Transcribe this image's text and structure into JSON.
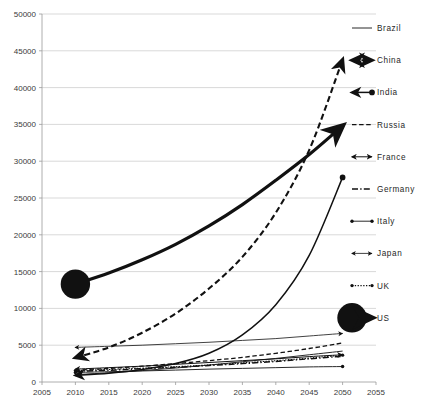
{
  "chart_data": {
    "type": "line",
    "title": "",
    "xlabel": "",
    "ylabel": "",
    "xlim": [
      2005,
      2055
    ],
    "ylim": [
      0,
      50000
    ],
    "grid": true,
    "legend_position": "right",
    "x_ticks": [
      "2005",
      "2010",
      "2015",
      "2020",
      "2025",
      "2030",
      "2035",
      "2040",
      "2045",
      "2050",
      "2055"
    ],
    "y_ticks": [
      "0",
      "5000",
      "10000",
      "15000",
      "20000",
      "25000",
      "30000",
      "35000",
      "40000",
      "45000",
      "50000"
    ],
    "x": [
      2010,
      2015,
      2020,
      2025,
      2030,
      2035,
      2040,
      2045,
      2050
    ],
    "series": [
      {
        "name": "Brazil",
        "marker": "plain-line",
        "values": [
          1000,
          1250,
          1550,
          1900,
          2300,
          2750,
          3200,
          3700,
          4200
        ]
      },
      {
        "name": "China",
        "marker": "double-arrow-bold",
        "values": [
          3300,
          4700,
          6700,
          9300,
          12700,
          17000,
          23000,
          31500,
          43800
        ]
      },
      {
        "name": "India",
        "marker": "left-arrow-dot",
        "values": [
          900,
          1200,
          1700,
          2500,
          3900,
          6400,
          10500,
          17200,
          27800
        ]
      },
      {
        "name": "Russia",
        "marker": "dashed",
        "values": [
          1600,
          1850,
          2150,
          2500,
          2900,
          3350,
          3900,
          4550,
          5300
        ]
      },
      {
        "name": "France",
        "marker": "double-arrow-open",
        "values": [
          1750,
          1950,
          2150,
          2400,
          2650,
          2900,
          3150,
          3450,
          3700
        ]
      },
      {
        "name": "Germany",
        "marker": "dash-dot",
        "values": [
          1450,
          1600,
          1800,
          2000,
          2250,
          2500,
          2800,
          3150,
          3500
        ]
      },
      {
        "name": "Italy",
        "marker": "dot-line-dot",
        "values": [
          1300,
          1400,
          1500,
          1620,
          1750,
          1850,
          1950,
          2050,
          2100
        ]
      },
      {
        "name": "Japan",
        "marker": "left-right-arrow",
        "values": [
          4700,
          4850,
          5000,
          5200,
          5400,
          5650,
          5900,
          6250,
          6600
        ]
      },
      {
        "name": "UK",
        "marker": "dotted-dot",
        "values": [
          1550,
          1700,
          1880,
          2080,
          2320,
          2600,
          2900,
          3250,
          3650
        ]
      },
      {
        "name": "US",
        "marker": "bold-arrow-dot",
        "values": [
          13300,
          14800,
          16600,
          18700,
          21200,
          24100,
          27400,
          30900,
          34800
        ]
      }
    ]
  },
  "legend": {
    "items": [
      {
        "label": "Brazil",
        "icon": "plain-line-icon"
      },
      {
        "label": "China",
        "icon": "double-arrow-bold-icon"
      },
      {
        "label": "India",
        "icon": "left-arrow-dot-icon"
      },
      {
        "label": "Russia",
        "icon": "dashed-line-icon"
      },
      {
        "label": "France",
        "icon": "double-arrow-open-icon"
      },
      {
        "label": "Germany",
        "icon": "dash-dot-line-icon"
      },
      {
        "label": "Italy",
        "icon": "dot-line-dot-icon"
      },
      {
        "label": "Japan",
        "icon": "left-right-arrow-icon"
      },
      {
        "label": "UK",
        "icon": "dotted-line-dot-icon"
      },
      {
        "label": "US",
        "icon": "bold-arrow-dot-icon"
      }
    ]
  }
}
